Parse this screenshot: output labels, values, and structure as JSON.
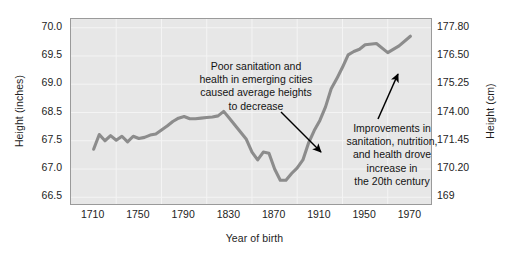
{
  "chart_data": {
    "type": "line",
    "title": "",
    "xlabel": "Year of birth",
    "ylabel": "Height (inches)",
    "ylabel_right": "Height (cm)",
    "xlim": [
      1710,
      1970
    ],
    "ylim": [
      66.5,
      70.0
    ],
    "grid": true,
    "legend": "none",
    "line_color": "#8c8c8c",
    "plot_bg_color": "#e7e7e7",
    "text_color": "#1d1d1d",
    "arrow_color": "#000000",
    "xticks": [
      "1710",
      "1750",
      "1790",
      "1830",
      "1870",
      "1910",
      "1950",
      "1970"
    ],
    "yticks_left": [
      "70.0",
      "69.5",
      "69.0",
      "68.5",
      "67.5",
      "67.0",
      "66.5"
    ],
    "yticks_right": [
      "177.80",
      "176.50",
      "175.25",
      "174.00",
      "171.45",
      "170.20",
      "169"
    ],
    "series": [
      {
        "name": "Average male height at age of birth year",
        "x": [
          1710,
          1715,
          1720,
          1725,
          1730,
          1735,
          1740,
          1745,
          1750,
          1755,
          1760,
          1765,
          1770,
          1775,
          1780,
          1785,
          1790,
          1795,
          1800,
          1805,
          1810,
          1815,
          1820,
          1825,
          1830,
          1835,
          1840,
          1845,
          1850,
          1855,
          1860,
          1865,
          1870,
          1875,
          1880,
          1885,
          1890,
          1895,
          1900,
          1905,
          1910,
          1915,
          1920,
          1925,
          1930,
          1935,
          1940,
          1945,
          1950,
          1955,
          1960,
          1965,
          1970
        ],
        "values": [
          67.35,
          67.72,
          67.5,
          67.68,
          67.52,
          67.66,
          67.48,
          67.66,
          67.58,
          67.62,
          67.7,
          67.74,
          67.88,
          68.02,
          68.18,
          68.3,
          68.36,
          68.28,
          68.28,
          68.3,
          68.32,
          68.34,
          68.38,
          68.52,
          68.3,
          68.05,
          67.8,
          67.55,
          67.3,
          67.16,
          67.3,
          67.28,
          67.0,
          66.8,
          66.8,
          66.92,
          67.02,
          67.16,
          67.46,
          67.86,
          68.22,
          68.6,
          68.92,
          69.1,
          69.3,
          69.52,
          69.58,
          69.62,
          69.7,
          69.72,
          69.56,
          69.68,
          69.85
        ]
      }
    ],
    "annotations": [
      {
        "id": "annotation-sanitation-decline",
        "text": "Poor sanitation and\nhealth in emerging cities\ncaused average heights\nto decrease",
        "arrow_from_x": 281,
        "arrow_from_y": 112,
        "arrow_to_x": 321,
        "arrow_to_y": 152
      },
      {
        "id": "annotation-improvements-increase",
        "text": "Improvements in\nsanitation, nutrition,\nand health drove\nincrease in\nthe 20th century",
        "arrow_from_x": 378,
        "arrow_from_y": 119,
        "arrow_to_x": 398,
        "arrow_to_y": 74
      }
    ]
  }
}
